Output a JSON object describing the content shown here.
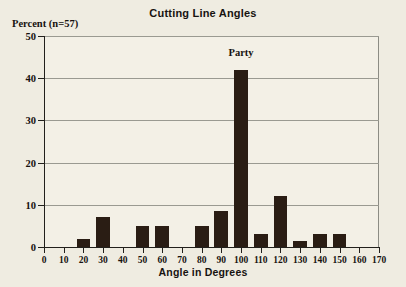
{
  "chart_data": {
    "type": "bar",
    "title": "Cutting Line Angles",
    "xlabel": "Angle in Degrees",
    "ylabel": "Percent  (n=57)",
    "xlim": [
      0,
      170
    ],
    "ylim": [
      0,
      50
    ],
    "grid": true,
    "legend": "none",
    "xticks": [
      0,
      10,
      20,
      30,
      40,
      50,
      60,
      70,
      80,
      90,
      100,
      110,
      120,
      130,
      140,
      150,
      160,
      170
    ],
    "yticks": [
      0,
      10,
      20,
      30,
      40,
      50
    ],
    "xtick_labels": [
      "0",
      "10",
      "20",
      "30",
      "40",
      "50",
      "60",
      "70",
      "80",
      "90",
      "100",
      "110",
      "120",
      "130",
      "140",
      "150",
      "160",
      "170"
    ],
    "ytick_labels": [
      "0",
      "10",
      "20",
      "30",
      "40",
      "50"
    ],
    "categories": [
      20,
      30,
      50,
      60,
      80,
      90,
      100,
      110,
      120,
      130,
      140,
      150
    ],
    "values": [
      2,
      7,
      5,
      5,
      5,
      8.5,
      42,
      3,
      12,
      1.5,
      3,
      3
    ],
    "bar_color": "#2a1d14",
    "bar_width_degrees": 7,
    "annotations": [
      {
        "text": "Party",
        "x": 100,
        "y": 46
      }
    ]
  },
  "figure": {
    "background_color": "#efece1",
    "plot_background_color": "#f3f0e6",
    "axis_color": "#22201c",
    "grid_color": "#9a9a91"
  }
}
